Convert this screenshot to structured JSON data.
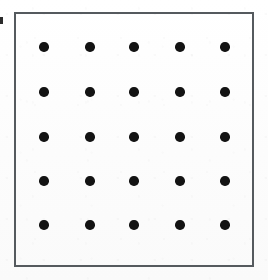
{
  "figure": {
    "title": "",
    "background_color": "#fdfdfd",
    "frame": {
      "name": "plot-frame",
      "border_color": "#555a5e",
      "border_width_px": 2,
      "x": 14,
      "y": 12,
      "width": 240,
      "height": 255
    },
    "edge_artifact": {
      "name": "scan-edge-mark",
      "description": "clipped dark mark at left image edge",
      "color": "#2b2b2b",
      "x": 0,
      "y": 17,
      "width": 3,
      "height": 7
    }
  },
  "chart_data": {
    "type": "scatter",
    "title": "",
    "subtitle": "",
    "xlabel": "",
    "ylabel": "",
    "xlim": [
      0,
      6
    ],
    "ylim": [
      0,
      6
    ],
    "grid": false,
    "legend": null,
    "legend_position": "none",
    "annotations": [],
    "marker": {
      "shape": "circle",
      "color": "#131313",
      "diameter_px": 9.5,
      "filled": true
    },
    "rows": 5,
    "columns": 5,
    "point_count": 25,
    "xticks": [
      1,
      2,
      3,
      4,
      5
    ],
    "yticks": [
      1,
      2,
      3,
      4,
      5
    ],
    "xtick_labels": [],
    "ytick_labels": [],
    "x": [
      1,
      2,
      3,
      4,
      5,
      1,
      2,
      3,
      4,
      5,
      1,
      2,
      3,
      4,
      5,
      1,
      2,
      3,
      4,
      5,
      1,
      2,
      3,
      4,
      5
    ],
    "y": [
      5,
      5,
      5,
      5,
      5,
      4,
      4,
      4,
      4,
      4,
      3,
      3,
      3,
      3,
      3,
      2,
      2,
      2,
      2,
      2,
      1,
      1,
      1,
      1,
      1
    ],
    "pixel_points": [
      {
        "cx": 44,
        "cy": 47
      },
      {
        "cx": 90,
        "cy": 47
      },
      {
        "cx": 134,
        "cy": 47
      },
      {
        "cx": 180,
        "cy": 47
      },
      {
        "cx": 225,
        "cy": 47
      },
      {
        "cx": 44,
        "cy": 92
      },
      {
        "cx": 90,
        "cy": 92
      },
      {
        "cx": 134,
        "cy": 92
      },
      {
        "cx": 180,
        "cy": 92
      },
      {
        "cx": 225,
        "cy": 92
      },
      {
        "cx": 44,
        "cy": 137
      },
      {
        "cx": 90,
        "cy": 137
      },
      {
        "cx": 134,
        "cy": 137
      },
      {
        "cx": 180,
        "cy": 137
      },
      {
        "cx": 225,
        "cy": 137
      },
      {
        "cx": 44,
        "cy": 181
      },
      {
        "cx": 90,
        "cy": 181
      },
      {
        "cx": 134,
        "cy": 181
      },
      {
        "cx": 180,
        "cy": 181
      },
      {
        "cx": 225,
        "cy": 181
      },
      {
        "cx": 44,
        "cy": 225
      },
      {
        "cx": 90,
        "cy": 225
      },
      {
        "cx": 134,
        "cy": 225
      },
      {
        "cx": 180,
        "cy": 225
      },
      {
        "cx": 225,
        "cy": 225
      }
    ]
  }
}
